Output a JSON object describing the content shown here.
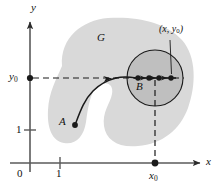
{
  "figure": {
    "name": "open-region-connectedness-diagram",
    "background_color": "#ffffff",
    "region_fill": "#d9d9d9",
    "disk_fill": "#b0b0b0",
    "stroke_color": "#1a1a1a",
    "axis_color": "#5a5a5a"
  },
  "axes": {
    "x_label": "x",
    "y_label": "y",
    "origin_label": "0",
    "x_tick_label": "1",
    "y_tick_label": "1"
  },
  "labels": {
    "region": "G",
    "start_point": "A",
    "disk_point": "B",
    "y_zero": "y",
    "y_zero_sub": "0",
    "x_zero": "x",
    "x_zero_sub": "0",
    "coord_open": "(",
    "coord_x": "x",
    "coord_sep": ", ",
    "coord_y": "y",
    "coord_y_sub": "0",
    "coord_close": ")"
  },
  "geometry": {
    "disk_center_x": 155,
    "disk_center_y": 78,
    "disk_radius": 28,
    "y_zero_axis_y": 78,
    "x_zero_axis_x": 155,
    "x_axis_y": 163,
    "y_axis_x": 30
  },
  "path_dots": [
    {
      "cx": 138,
      "cy": 78
    },
    {
      "cx": 148,
      "cy": 78
    },
    {
      "cx": 158,
      "cy": 78
    },
    {
      "cx": 171,
      "cy": 78
    }
  ]
}
